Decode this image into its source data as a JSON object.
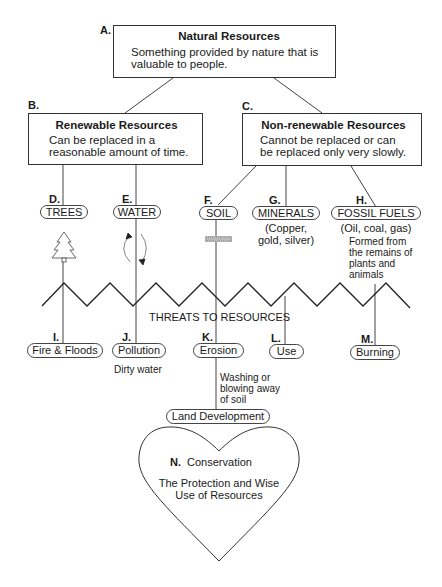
{
  "diagram": {
    "natural": {
      "letter": "A.",
      "title": "Natural Resources",
      "desc_line1": "Something provided by nature that is",
      "desc_line2": "valuable to people."
    },
    "renewable": {
      "letter": "B.",
      "title": "Renewable Resources",
      "desc_line1": "Can be replaced in a",
      "desc_line2": "reasonable amount of time."
    },
    "nonrenewable": {
      "letter": "C.",
      "title": "Non-renewable Resources",
      "desc_line1": "Cannot be replaced  or can",
      "desc_line2": "be replaced only very slowly."
    },
    "resources": [
      {
        "letter": "D.",
        "label": "TREES",
        "icon": "tree-icon"
      },
      {
        "letter": "E.",
        "label": "WATER",
        "icon": "water-cycle-icon"
      },
      {
        "letter": "F.",
        "label": "SOIL",
        "icon": "soil-texture-icon"
      },
      {
        "letter": "G.",
        "label": "MINERALS",
        "note_line1": "(Copper,",
        "note_line2": "gold, silver)"
      },
      {
        "letter": "H.",
        "label": "FOSSIL FUELS",
        "note_line1": "(Oil, coal, gas)",
        "detail_line1": "Formed from",
        "detail_line2": "the remains of",
        "detail_line3": "plants and",
        "detail_line4": "animals"
      }
    ],
    "threats_label": "THREATS TO RESOURCES",
    "threats": [
      {
        "letter": "I.",
        "label": "Fire & Floods"
      },
      {
        "letter": "J.",
        "label": "Pollution",
        "note": "Dirty water"
      },
      {
        "letter": "K.",
        "label": "Erosion",
        "note_line1": "Washing or",
        "note_line2": "blowing away",
        "note_line3": "of soil"
      },
      {
        "letter": "L.",
        "label": "Use"
      },
      {
        "letter": "M.",
        "label": "Burning"
      }
    ],
    "land_development": "Land Development",
    "conservation": {
      "letter": "N.",
      "title": "Conservation",
      "desc_line1": "The Protection and Wise",
      "desc_line2": "Use of Resources"
    },
    "colors": {
      "line": "#333333",
      "text": "#1a1a1a",
      "background": "#ffffff"
    }
  }
}
